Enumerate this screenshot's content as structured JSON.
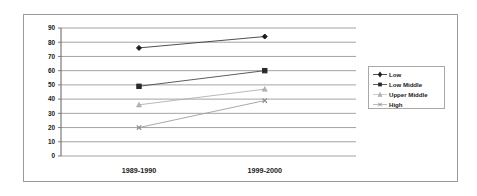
{
  "chart_data": {
    "type": "line",
    "title": "",
    "xlabel": "",
    "ylabel": "",
    "categories": [
      "1989-1990",
      "1999-2000"
    ],
    "ylim": [
      0,
      90
    ],
    "yticks": [
      90,
      80,
      70,
      60,
      50,
      40,
      30,
      20,
      10,
      0
    ],
    "ytick_labels": [
      "90",
      "80",
      "70",
      "60",
      "50",
      "40",
      "30",
      "20",
      "10",
      "0"
    ],
    "grid": true,
    "legend_position": "right",
    "series": [
      {
        "name": "Low",
        "values": [
          76,
          84
        ],
        "marker": "diamond",
        "color": "#1c1c1c"
      },
      {
        "name": "Low Middle",
        "values": [
          49,
          60
        ],
        "marker": "square",
        "color": "#2a2a2a"
      },
      {
        "name": "Upper Middle",
        "values": [
          36,
          47
        ],
        "marker": "triangle",
        "color": "#b4b4b4"
      },
      {
        "name": "High",
        "values": [
          20,
          39
        ],
        "marker": "cross",
        "color": "#8f8f8f"
      }
    ]
  },
  "legend": {
    "entries": [
      {
        "label": "Low"
      },
      {
        "label": "Low Middle"
      },
      {
        "label": "Upper Middle"
      },
      {
        "label": "High"
      }
    ]
  },
  "axis": {
    "y_labels": [
      "90",
      "80",
      "70",
      "60",
      "50",
      "40",
      "30",
      "20",
      "10",
      "0"
    ],
    "x_labels": [
      "1989-1990",
      "1999-2000"
    ]
  },
  "colors": {
    "frame": "#9a9a9a",
    "gridline": "#8c8c8c",
    "axis": "#6e6e6e",
    "text": "#1a1a1a",
    "background": "#ffffff"
  }
}
